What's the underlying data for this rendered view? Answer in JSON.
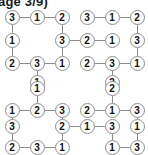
{
  "header": {
    "text": "age 3/9)"
  },
  "style": {
    "node_stroke": "#8c8c8c",
    "node_fill": "#ffffff",
    "edge_color": "#8c8c8c",
    "digit_color": "#111111",
    "header_color": "#1a1a1a"
  },
  "puzzle_data": {
    "type": "graph",
    "description": "Four number-network puzzle grids arranged 2x2; circled digits joined by straight links",
    "grid_spacing_px": 25,
    "puzzles": [
      {
        "name": "top-left",
        "nodes": [
          {
            "id": "tl-a",
            "value": "3",
            "x": 12,
            "y": 17
          },
          {
            "id": "tl-b",
            "value": "1",
            "x": 37,
            "y": 17
          },
          {
            "id": "tl-c",
            "value": "2",
            "x": 62,
            "y": 17
          },
          {
            "id": "tl-d",
            "value": "1",
            "x": 12,
            "y": 40
          },
          {
            "id": "tl-e",
            "value": "3",
            "x": 62,
            "y": 40
          },
          {
            "id": "tl-f",
            "value": "2",
            "x": 12,
            "y": 63
          },
          {
            "id": "tl-g",
            "value": "3",
            "x": 37,
            "y": 63
          },
          {
            "id": "tl-h",
            "value": "1",
            "x": 62,
            "y": 63
          },
          {
            "id": "tl-i",
            "value": "1",
            "x": 37,
            "y": 82
          }
        ],
        "edges": [
          [
            "tl-a",
            "tl-b"
          ],
          [
            "tl-b",
            "tl-c"
          ],
          [
            "tl-a",
            "tl-d"
          ],
          [
            "tl-c",
            "tl-e"
          ],
          [
            "tl-d",
            "tl-f"
          ],
          [
            "tl-e",
            "tl-h"
          ],
          [
            "tl-f",
            "tl-g"
          ],
          [
            "tl-g",
            "tl-h"
          ],
          [
            "tl-g",
            "tl-i"
          ]
        ]
      },
      {
        "name": "bridge-top",
        "nodes": [
          {
            "id": "bt-a",
            "value": "2",
            "x": 87,
            "y": 40
          }
        ],
        "edges": [
          [
            "tl-e",
            "bt-a"
          ],
          [
            "bt-a",
            "tr-d"
          ]
        ]
      },
      {
        "name": "top-right",
        "nodes": [
          {
            "id": "tr-a",
            "value": "3",
            "x": 87,
            "y": 17
          },
          {
            "id": "tr-b",
            "value": "1",
            "x": 112,
            "y": 17
          },
          {
            "id": "tr-c",
            "value": "2",
            "x": 137,
            "y": 17
          },
          {
            "id": "tr-d",
            "value": "1",
            "x": 112,
            "y": 40
          },
          {
            "id": "tr-e",
            "value": "3",
            "x": 137,
            "y": 40
          },
          {
            "id": "tr-f",
            "value": "2",
            "x": 87,
            "y": 63
          },
          {
            "id": "tr-g",
            "value": "3",
            "x": 112,
            "y": 63
          },
          {
            "id": "tr-h",
            "value": "1",
            "x": 137,
            "y": 63
          },
          {
            "id": "tr-i",
            "value": "2",
            "x": 112,
            "y": 82
          }
        ],
        "edges": [
          [
            "tr-a",
            "tr-b"
          ],
          [
            "tr-b",
            "tr-c"
          ],
          [
            "tr-a",
            "tr-d"
          ],
          [
            "tr-c",
            "tr-e"
          ],
          [
            "tr-d",
            "tr-f"
          ],
          [
            "tr-e",
            "tr-h"
          ],
          [
            "tr-f",
            "tr-g"
          ],
          [
            "tr-g",
            "tr-h"
          ],
          [
            "tr-g",
            "tr-i"
          ]
        ]
      },
      {
        "name": "bottom-left",
        "nodes": [
          {
            "id": "bl-z",
            "value": "1",
            "x": 37,
            "y": 88
          },
          {
            "id": "bl-a",
            "value": "1",
            "x": 12,
            "y": 110
          },
          {
            "id": "bl-b",
            "value": "2",
            "x": 37,
            "y": 110
          },
          {
            "id": "bl-c",
            "value": "3",
            "x": 62,
            "y": 110
          },
          {
            "id": "bl-d",
            "value": "3",
            "x": 12,
            "y": 126
          },
          {
            "id": "bl-e",
            "value": "2",
            "x": 62,
            "y": 126
          },
          {
            "id": "bl-f",
            "value": "2",
            "x": 12,
            "y": 147
          },
          {
            "id": "bl-g",
            "value": "3",
            "x": 37,
            "y": 147
          },
          {
            "id": "bl-h",
            "value": "1",
            "x": 62,
            "y": 147
          }
        ],
        "edges": [
          [
            "bl-z",
            "bl-b"
          ],
          [
            "bl-a",
            "bl-b"
          ],
          [
            "bl-b",
            "bl-c"
          ],
          [
            "bl-a",
            "bl-d"
          ],
          [
            "bl-c",
            "bl-e"
          ],
          [
            "bl-d",
            "bl-f"
          ],
          [
            "bl-e",
            "bl-h"
          ],
          [
            "bl-f",
            "bl-g"
          ],
          [
            "bl-g",
            "bl-h"
          ]
        ]
      },
      {
        "name": "bridge-bottom",
        "nodes": [
          {
            "id": "bb-a",
            "value": "1",
            "x": 87,
            "y": 126
          }
        ],
        "edges": [
          [
            "bl-e",
            "bb-a"
          ],
          [
            "bb-a",
            "br-d"
          ]
        ]
      },
      {
        "name": "bottom-right",
        "nodes": [
          {
            "id": "br-z",
            "value": "2",
            "x": 112,
            "y": 88
          },
          {
            "id": "br-a",
            "value": "2",
            "x": 87,
            "y": 110
          },
          {
            "id": "br-b",
            "value": "1",
            "x": 112,
            "y": 110
          },
          {
            "id": "br-c",
            "value": "3",
            "x": 137,
            "y": 110
          },
          {
            "id": "br-d",
            "value": "3",
            "x": 112,
            "y": 126
          },
          {
            "id": "br-e",
            "value": "1",
            "x": 137,
            "y": 126
          },
          {
            "id": "br-f",
            "value": "1",
            "x": 112,
            "y": 147
          },
          {
            "id": "br-g",
            "value": "3",
            "x": 137,
            "y": 147
          },
          {
            "id": "br-h",
            "value": "2",
            "x": 160,
            "y": 147
          }
        ],
        "edges": [
          [
            "br-z",
            "br-b"
          ],
          [
            "br-a",
            "br-b"
          ],
          [
            "br-b",
            "br-c"
          ],
          [
            "br-c",
            "br-e"
          ],
          [
            "br-d",
            "br-f"
          ],
          [
            "br-e",
            "br-g"
          ],
          [
            "br-f",
            "br-g"
          ]
        ]
      }
    ]
  }
}
